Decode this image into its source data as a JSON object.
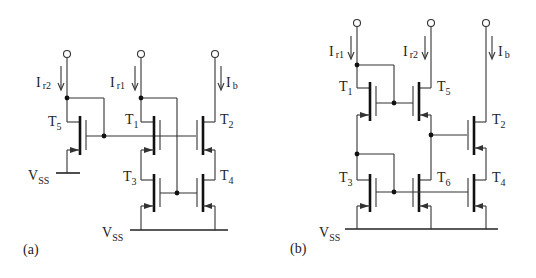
{
  "figure_a": {
    "label": "(a)",
    "currents": {
      "ir2": "I",
      "ir2_sub": "r2",
      "ir1": "I",
      "ir1_sub": "r1",
      "ib": "I",
      "ib_sub": "b"
    },
    "transistors": {
      "t5": {
        "main": "T",
        "sub": "5"
      },
      "t1": {
        "main": "T",
        "sub": "1"
      },
      "t2": {
        "main": "T",
        "sub": "2"
      },
      "t3": {
        "main": "T",
        "sub": "3"
      },
      "t4": {
        "main": "T",
        "sub": "4"
      }
    },
    "supplies": {
      "vss_left": {
        "main": "V",
        "sub": "SS"
      },
      "vss_bottom": {
        "main": "V",
        "sub": "SS"
      }
    }
  },
  "figure_b": {
    "label": "(b)",
    "currents": {
      "ir1": "I",
      "ir1_sub": "r1",
      "ir2": "I",
      "ir2_sub": "r2",
      "ib": "I",
      "ib_sub": "b"
    },
    "transistors": {
      "t1": {
        "main": "T",
        "sub": "1"
      },
      "t5": {
        "main": "T",
        "sub": "5"
      },
      "t2": {
        "main": "T",
        "sub": "2"
      },
      "t3": {
        "main": "T",
        "sub": "3"
      },
      "t6": {
        "main": "T",
        "sub": "6"
      },
      "t4": {
        "main": "T",
        "sub": "4"
      }
    },
    "supplies": {
      "vss": {
        "main": "V",
        "sub": "SS"
      }
    }
  }
}
